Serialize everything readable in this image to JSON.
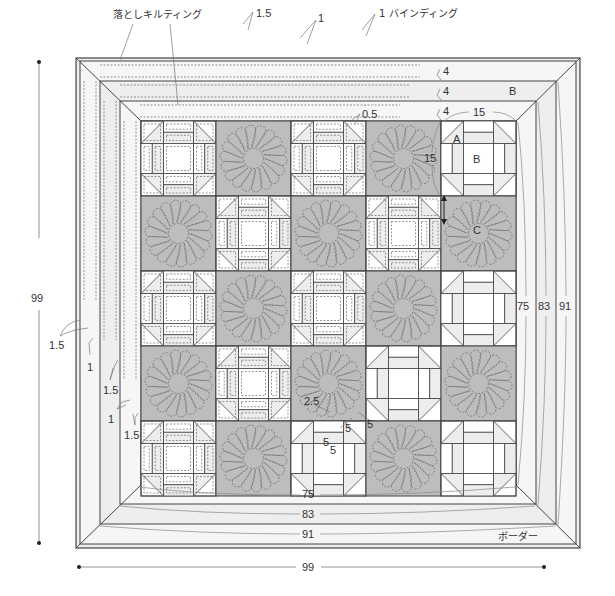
{
  "colors": {
    "line": "#444444",
    "border_fill": "#eeeeee",
    "border_fill_alt": "#f6f6f6",
    "block_gray": "#bdbdbd",
    "light_patch": "#ededed",
    "white": "#ffffff",
    "stitch": "#555555",
    "dim": "#666666"
  },
  "geometry": {
    "outer": [
      76,
      58,
      580,
      548
    ],
    "frames": [
      [
        80,
        61,
        576,
        544
      ],
      [
        100,
        81,
        556,
        524
      ],
      [
        120,
        101,
        536,
        504
      ],
      [
        141,
        121,
        516,
        485
      ]
    ],
    "grid": {
      "cols": 5,
      "rows": 5,
      "size": 75
    }
  },
  "blocks": [
    [
      "P",
      "F",
      "P",
      "F",
      "L"
    ],
    [
      "F",
      "P",
      "F",
      "P",
      "F"
    ],
    [
      "P",
      "F",
      "P",
      "F",
      "L"
    ],
    [
      "F",
      "P",
      "F",
      "L",
      "F"
    ],
    [
      "P",
      "F",
      "L",
      "F",
      "L"
    ]
  ],
  "labels": {
    "ditch_quilting": "落としキルティング",
    "binding": "1 バインディング",
    "border": "ボーダー",
    "piece_a": "A",
    "piece_b": "B",
    "piece_c": "C",
    "border_b": "B"
  },
  "dimensions": {
    "top_1_5": "1.5",
    "top_1": "1",
    "border_w1": "4",
    "border_w2": "4",
    "border_w3": "4",
    "seam_0_5": "0.5",
    "block_w": "15",
    "block_h": "15",
    "left_1_5_a": "1.5",
    "left_1_a": "1",
    "left_1_5_b": "1.5",
    "left_1_b": "1",
    "left_1_5_c": "1.5",
    "quilt_2_5": "2.5",
    "quilt_5_a": "5",
    "quilt_5_b": "5",
    "quilt_5_c": "5",
    "quilt_5_d": "5",
    "inner_75": "75",
    "inner_83": "83",
    "inner_91": "91",
    "right_75": "75",
    "right_83": "83",
    "right_91": "91",
    "overall_h": "99",
    "overall_w": "99"
  }
}
